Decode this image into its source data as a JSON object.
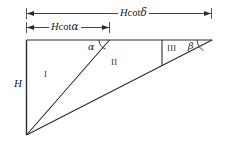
{
  "figure": {
    "name": "slope-geometry-diagram",
    "stroke_color": "#2b2b2b",
    "background_color": "#ffffff"
  },
  "dimensions": [
    {
      "id": "top",
      "name": "Hcotdelta",
      "prefix_var": "H",
      "function": "cot",
      "angle_symbol": "δ",
      "full_text": "Hcotδ",
      "arrows": "both"
    },
    {
      "id": "inner",
      "name": "Hcotalpha",
      "prefix_var": "H",
      "function": "cot",
      "angle_symbol": "α",
      "full_text": "Hcotα",
      "arrows": "both"
    }
  ],
  "height_label": {
    "text": "H"
  },
  "regions": [
    {
      "id": "I",
      "label": "I"
    },
    {
      "id": "II",
      "label": "II"
    },
    {
      "id": "III",
      "label": "III"
    }
  ],
  "angles": [
    {
      "id": "alpha",
      "symbol": "α"
    },
    {
      "id": "beta",
      "symbol": "β"
    }
  ]
}
